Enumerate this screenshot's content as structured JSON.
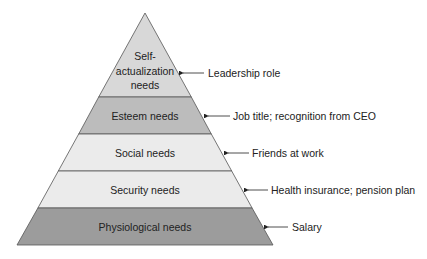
{
  "diagram": {
    "levels": [
      {
        "name": "Self-",
        "name2": "actualization",
        "name3": "needs",
        "example": "Leadership role",
        "color": "#d8d8d8"
      },
      {
        "name": "Esteem needs",
        "example": "Job title; recognition from CEO",
        "color": "#bcbcbc"
      },
      {
        "name": "Social needs",
        "example": "Friends at work",
        "color": "#ebebeb"
      },
      {
        "name": "Security needs",
        "example": "Health insurance; pension plan",
        "color": "#ebebeb"
      },
      {
        "name": "Physiological needs",
        "example": "Salary",
        "color": "#9c9c9c"
      }
    ]
  }
}
